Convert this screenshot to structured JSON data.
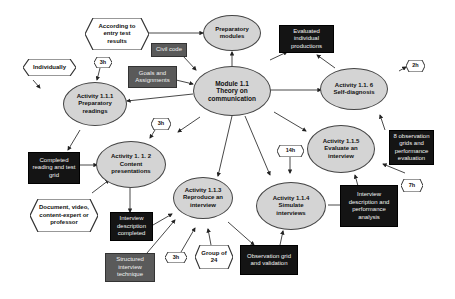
{
  "diagram": {
    "type": "concept-map",
    "central": {
      "id": "module",
      "label": "Module 1.1\nTheory on\ncommunication"
    },
    "activities": [
      {
        "id": "prep_modules",
        "label": "Preparatory\nmodules"
      },
      {
        "id": "a111",
        "label": "Activity 1.1.1\nPreparatory\nreadings"
      },
      {
        "id": "a112",
        "label": "Activity 1. 1. 2\nContent\npresentations"
      },
      {
        "id": "a113",
        "label": "Activity 1.1.3\nReproduce an\ninterview"
      },
      {
        "id": "a114",
        "label": "Activity 1.1.4\nSimulate\ninterviews"
      },
      {
        "id": "a115",
        "label": "Activity 1.1.5\nEvaluate an\ninterview"
      },
      {
        "id": "a116",
        "label": "Activity 1.1. 6\nSelf-diagnosis"
      }
    ],
    "products": [
      {
        "id": "evaluated",
        "label": "Evaluated\nindividual\nproductions"
      },
      {
        "id": "completed_reading",
        "label": "Completed\nreading and test\ngrid"
      },
      {
        "id": "interview_desc",
        "label": "Interview\ndescription\ncompleted"
      },
      {
        "id": "obs_grid",
        "label": "Observation grid\nand validation"
      },
      {
        "id": "interview_perf",
        "label": "Interview\ndescription and\nperformance\nanalysis"
      },
      {
        "id": "eight_obs",
        "label": "8 observation\ngrids and\nperformance\nevaluation"
      }
    ],
    "resources": [
      {
        "id": "civil_code",
        "label": "Civil code"
      },
      {
        "id": "goals",
        "label": "Goals and\nAssignments"
      },
      {
        "id": "structured",
        "label": "Structured\ninterview\ntechnique"
      }
    ],
    "conditions": [
      {
        "id": "entry_test",
        "label": "According to\nentry test\nresults"
      },
      {
        "id": "individually",
        "label": "Individually"
      },
      {
        "id": "document",
        "label": "Document, video,\ncontent-expert or\nprofessor"
      },
      {
        "id": "group24",
        "label": "Group of\n24"
      }
    ],
    "durations": [
      {
        "id": "d111",
        "label": "3h"
      },
      {
        "id": "d112",
        "label": "3h"
      },
      {
        "id": "d113",
        "label": "3h"
      },
      {
        "id": "d114",
        "label": "14h"
      },
      {
        "id": "d115",
        "label": "7h"
      },
      {
        "id": "d116",
        "label": "2h"
      }
    ],
    "link_labels": [
      "P",
      "C",
      "I/P",
      "R",
      "S"
    ],
    "colors": {
      "ellipse_fill": "#d4d4d4",
      "product_fill": "#141414",
      "resource_fill": "#5a5a5a",
      "condition_fill": "#ffffff",
      "line": "#333333"
    }
  }
}
